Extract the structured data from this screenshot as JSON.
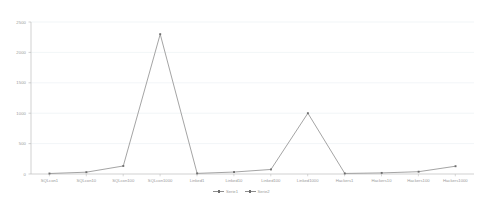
{
  "chart_data": {
    "type": "line",
    "title": "",
    "subtitle": "",
    "xlabel": "",
    "ylabel": "",
    "ylim": [
      0,
      2500
    ],
    "grid": true,
    "legend_position": "bottom",
    "categories": [
      "SQLcon1",
      "SQLcon10",
      "SQLcon100",
      "SQLcon1000",
      "Linked1",
      "Linked10",
      "Linked100",
      "Linked1000",
      "Hackers1",
      "Hackers10",
      "Hackers100",
      "Hackers1000"
    ],
    "ytick_labels": [
      "0",
      "500",
      "1000",
      "1500",
      "2000",
      "2500"
    ],
    "ytick_values": [
      0,
      500,
      1000,
      1500,
      2000,
      2500
    ],
    "series": [
      {
        "name": "Serie1",
        "values": [
          8,
          30,
          132,
          2300,
          10,
          32,
          75,
          1000,
          9,
          18,
          38,
          128
        ]
      },
      {
        "name": "Serie2",
        "values": [
          8,
          30,
          132,
          2300,
          10,
          32,
          75,
          1000,
          9,
          18,
          38,
          128
        ]
      }
    ],
    "legend": [
      "Serie1",
      "Serie2"
    ],
    "colors": {
      "line": "#8d8d8d",
      "marker": "#6e6e6e",
      "grid": "#e8eef2",
      "axis": "#c9c9c9",
      "tick_text": "#9a9a9a",
      "background": "#ffffff"
    }
  }
}
